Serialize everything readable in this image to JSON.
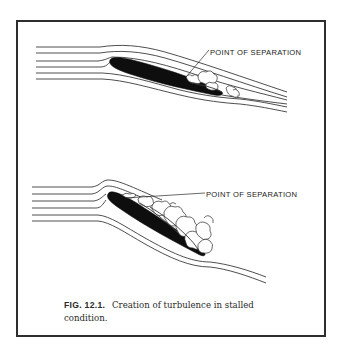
{
  "figure": {
    "number": "FIG. 12.1.",
    "caption": "Creation of turbulence in stalled condition.",
    "panels": [
      {
        "id": "top",
        "description": "Airfoil at low angle of attack with small separated region near trailing edge",
        "label": "POINT OF SEPARATION"
      },
      {
        "id": "bottom",
        "description": "Airfoil at high angle of attack (stalled) with large turbulent wake over upper surface",
        "label": "POINT OF SEPARATION"
      }
    ]
  },
  "colors": {
    "ink": "#0e0e0e",
    "frame": "#2e2e2e",
    "background": "#ffffff"
  }
}
